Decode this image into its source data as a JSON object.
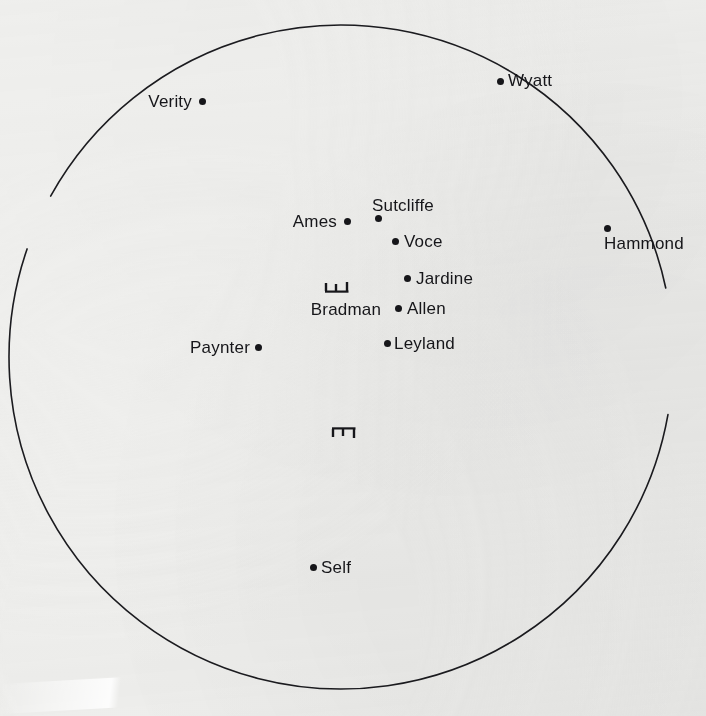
{
  "diagram": {
    "type": "field-placement",
    "background_color": "#efefed",
    "ink_color": "#16161a",
    "boundary": {
      "shape": "circle",
      "center_x": 341,
      "center_y": 357,
      "radius": 332,
      "stroke_width": 1.6,
      "gaps_for_labels": [
        "Verity",
        "Wyatt",
        "Hammond"
      ]
    },
    "wickets": [
      {
        "name": "batting-wicket",
        "x": 337,
        "y": 287,
        "orientation": "up",
        "label": "Bradman"
      },
      {
        "name": "bowling-wicket",
        "x": 344,
        "y": 432,
        "orientation": "down",
        "label": ""
      }
    ],
    "fielders": [
      {
        "name": "Verity",
        "dot_x": 202,
        "dot_y": 101,
        "label_x": 192,
        "label_y": 101,
        "label_side": "left"
      },
      {
        "name": "Wyatt",
        "dot_x": 500,
        "dot_y": 81,
        "label_x": 508,
        "label_y": 80,
        "label_side": "right"
      },
      {
        "name": "Hammond",
        "dot_x": 607,
        "dot_y": 228,
        "label_x": 644,
        "label_y": 243,
        "label_side": "center"
      },
      {
        "name": "Sutcliffe",
        "dot_x": 378,
        "dot_y": 218,
        "label_x": 372,
        "label_y": 205,
        "label_side": "right"
      },
      {
        "name": "Ames",
        "dot_x": 347,
        "dot_y": 221,
        "label_x": 337,
        "label_y": 221,
        "label_side": "left"
      },
      {
        "name": "Voce",
        "dot_x": 395,
        "dot_y": 241,
        "label_x": 404,
        "label_y": 241,
        "label_side": "right"
      },
      {
        "name": "Jardine",
        "dot_x": 407,
        "dot_y": 278,
        "label_x": 416,
        "label_y": 278,
        "label_side": "right"
      },
      {
        "name": "Allen",
        "dot_x": 398,
        "dot_y": 308,
        "label_x": 407,
        "label_y": 308,
        "label_side": "right"
      },
      {
        "name": "Leyland",
        "dot_x": 387,
        "dot_y": 343,
        "label_x": 394,
        "label_y": 343,
        "label_side": "right"
      },
      {
        "name": "Paynter",
        "dot_x": 258,
        "dot_y": 347,
        "label_x": 250,
        "label_y": 347,
        "label_side": "left"
      },
      {
        "name": "Self",
        "dot_x": 313,
        "dot_y": 567,
        "label_x": 321,
        "label_y": 567,
        "label_side": "right"
      }
    ],
    "bradman_label": {
      "text": "Bradman",
      "x": 346,
      "y": 309
    }
  }
}
